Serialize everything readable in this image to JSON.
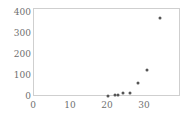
{
  "chart_data": {
    "type": "scatter",
    "title": "",
    "subtitle": "",
    "xlabel": "",
    "ylabel": "",
    "xlim": [
      0,
      39.7
    ],
    "ylim": [
      0,
      420
    ],
    "grid": false,
    "legend": null,
    "x_ticks": [
      0,
      10,
      20,
      30
    ],
    "y_ticks": [
      0,
      100,
      200,
      300,
      400
    ],
    "x_tick_labels": [
      "0",
      "10",
      "20",
      "30"
    ],
    "y_tick_labels": [
      "0",
      "100",
      "200",
      "300",
      "400"
    ],
    "marker": {
      "shape": "circle",
      "color": "#555555",
      "size_px": 3
    },
    "series": [
      {
        "name": "series-1",
        "points": [
          {
            "x": 20.0,
            "y": 3
          },
          {
            "x": 21.9,
            "y": 8
          },
          {
            "x": 22.8,
            "y": 10
          },
          {
            "x": 24.1,
            "y": 18
          },
          {
            "x": 25.9,
            "y": 20
          },
          {
            "x": 28.0,
            "y": 68
          },
          {
            "x": 30.5,
            "y": 128
          },
          {
            "x": 34.0,
            "y": 378
          }
        ]
      }
    ]
  },
  "figure": {
    "caption": "",
    "axis_frame_color": "#cfcfcf",
    "background": "#ffffff",
    "text_color": "#6f6f6f"
  }
}
